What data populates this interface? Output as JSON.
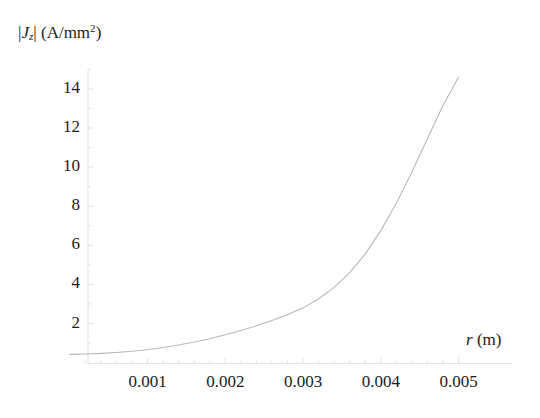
{
  "chart_data": {
    "type": "line",
    "title": "",
    "ylabel_text": "|Jz| (A/mm^2)",
    "ylabel_parts": {
      "bar_open": "|",
      "symbol": "J",
      "subscript": "z",
      "bar_close": "|",
      "units_open": " (A/mm",
      "units_exponent": "2",
      "units_close": ")"
    },
    "xlabel_text": "r (m)",
    "xlabel_parts": {
      "symbol": "r",
      "units": " (m)"
    },
    "xlabel": "r (m)",
    "ylabel": "|Jz| (A/mm2)",
    "xlim": [
      0.0,
      0.005
    ],
    "ylim": [
      0.0,
      15.2
    ],
    "xticks": [
      0.001,
      0.002,
      0.003,
      0.004,
      0.005
    ],
    "xtick_labels": [
      "0.001",
      "0.002",
      "0.003",
      "0.004",
      "0.005"
    ],
    "yticks": [
      2,
      4,
      6,
      8,
      10,
      12,
      14
    ],
    "ytick_labels": [
      "2",
      "4",
      "6",
      "8",
      "10",
      "12",
      "14"
    ],
    "grid": false,
    "legend": null,
    "line_color": "#b9b9b9",
    "axis_color": "#e2e2e2",
    "series": [
      {
        "name": "|Jz|",
        "x": [
          0.0,
          0.0002,
          0.0004,
          0.0006,
          0.0008,
          0.001,
          0.0012,
          0.0014,
          0.0016,
          0.0018,
          0.002,
          0.0022,
          0.0024,
          0.0026,
          0.0028,
          0.003,
          0.0032,
          0.0034,
          0.0036,
          0.0038,
          0.004,
          0.0042,
          0.0044,
          0.0046,
          0.0048,
          0.005
        ],
        "values": [
          0.42,
          0.44,
          0.47,
          0.52,
          0.58,
          0.66,
          0.77,
          0.9,
          1.05,
          1.22,
          1.42,
          1.64,
          1.88,
          2.15,
          2.45,
          2.8,
          3.25,
          3.85,
          4.6,
          5.55,
          6.75,
          8.15,
          9.75,
          11.45,
          13.15,
          14.6
        ]
      }
    ]
  }
}
